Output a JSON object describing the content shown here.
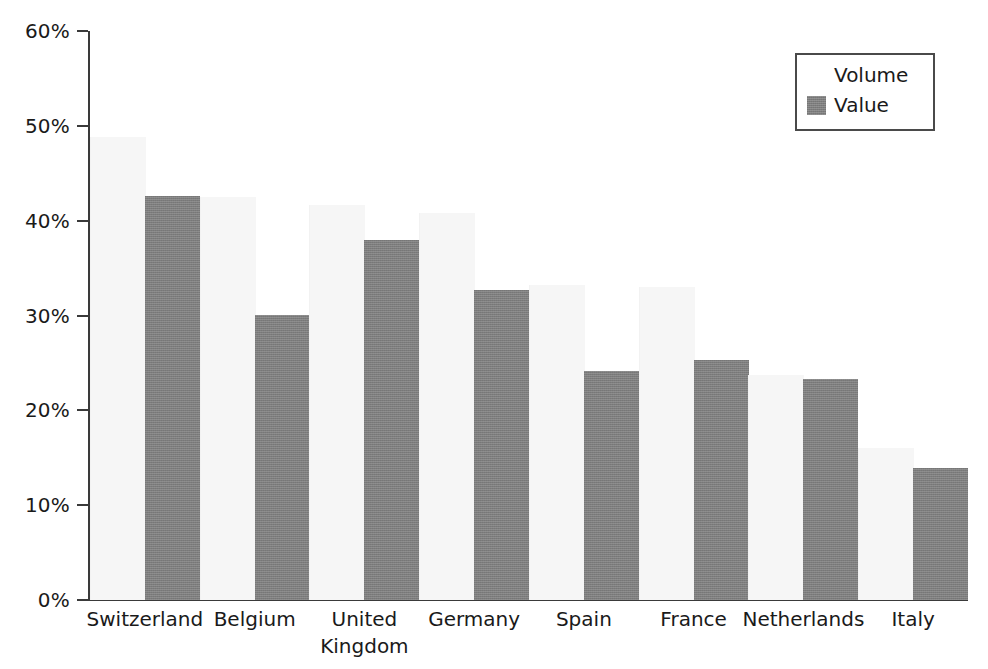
{
  "chart_data": {
    "type": "bar",
    "title": "",
    "subtitle": "",
    "xlabel": "",
    "ylabel": "",
    "ylim": [
      0,
      60
    ],
    "y_tick_labels": [
      "0%",
      "10%",
      "20%",
      "30%",
      "40%",
      "50%",
      "60%"
    ],
    "y_tick_values": [
      0,
      10,
      20,
      30,
      40,
      50,
      60
    ],
    "grid": false,
    "legend_position": "top-right",
    "categories": [
      "Switzerland",
      "Belgium",
      "United\nKingdom",
      "Germany",
      "Spain",
      "France",
      "Netherlands",
      "Italy"
    ],
    "series": [
      {
        "name": "Volume",
        "color": "#f6f6f6",
        "values": [
          48.8,
          42.5,
          41.7,
          40.8,
          33.2,
          33.0,
          23.7,
          16.0
        ]
      },
      {
        "name": "Value",
        "color": "#7d7d7d",
        "values": [
          42.6,
          30.1,
          38.0,
          32.7,
          24.1,
          25.3,
          23.3,
          13.9
        ]
      }
    ]
  },
  "legend": {
    "items": [
      {
        "label": "Volume",
        "swatch": "legend-swatch-volume"
      },
      {
        "label": "Value",
        "swatch": "legend-swatch-value"
      }
    ]
  },
  "colors": {
    "volume": "#f6f6f6",
    "value": "#7d7d7d",
    "axis": "#3a3a3a",
    "text": "#1a1a1a",
    "legend_border": "#4a4a4a",
    "background": "#ffffff"
  }
}
